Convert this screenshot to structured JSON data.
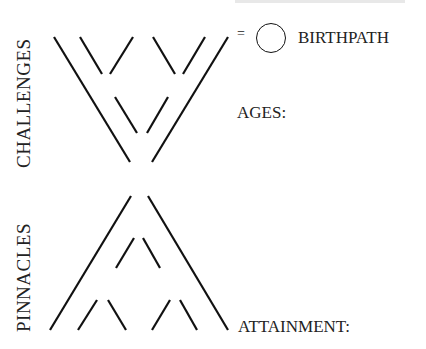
{
  "labels": {
    "challenges": "CHALLENGES",
    "pinnacles": "PINNACLES",
    "equals": "=",
    "birthpath": "BIRTHPATH",
    "ages": "AGES:",
    "attainment": "ATTAINMENT:"
  },
  "icons": {
    "birthpath_symbol": "empty-circle"
  }
}
